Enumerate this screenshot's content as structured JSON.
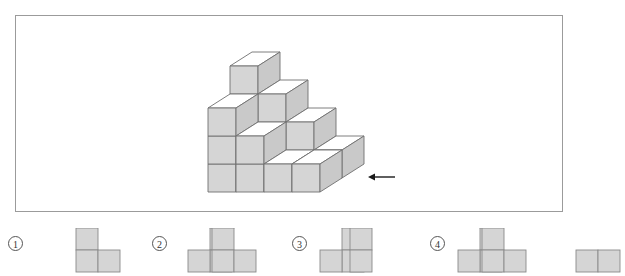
{
  "page": {
    "kind": "spatial-reasoning-question",
    "background_color": "#ffffff"
  },
  "panel": {
    "border_color": "#9b9b9b",
    "fill_color": "#ffffff",
    "figure": {
      "name": "isometric-cube-stack",
      "description": "Three-dimensional stack of unit cubes drawn in isometric projection",
      "cube_top_color": "#ffffff",
      "cube_left_color": "#d5d5d5",
      "cube_right_color": "#c9c9c9",
      "cube_edge_color": "#6f6f6f",
      "cube_unit_width": 28,
      "cube_unit_height": 28,
      "cube_depth_x": 22,
      "cube_depth_y": -14,
      "cubes": [
        {
          "x": 0,
          "y": 0,
          "z": 0
        },
        {
          "x": 0,
          "y": 0,
          "z": 1
        },
        {
          "x": 0,
          "y": 0,
          "z": 2
        },
        {
          "x": 1,
          "y": 0,
          "z": 0
        },
        {
          "x": 1,
          "y": 0,
          "z": 1
        },
        {
          "x": 2,
          "y": 0,
          "z": 0
        },
        {
          "x": 3,
          "y": 0,
          "z": 0
        },
        {
          "x": 0,
          "y": 1,
          "z": 0
        },
        {
          "x": 0,
          "y": 1,
          "z": 1
        },
        {
          "x": 0,
          "y": 1,
          "z": 2
        },
        {
          "x": 0,
          "y": 1,
          "z": 3
        },
        {
          "x": 1,
          "y": 1,
          "z": 0
        },
        {
          "x": 1,
          "y": 1,
          "z": 1
        },
        {
          "x": 1,
          "y": 1,
          "z": 2
        },
        {
          "x": 2,
          "y": 1,
          "z": 0
        },
        {
          "x": 2,
          "y": 1,
          "z": 1
        },
        {
          "x": 3,
          "y": 1,
          "z": 0
        }
      ]
    },
    "arrow": {
      "name": "left-arrow",
      "direction": "left",
      "color": "#1a1a1a",
      "meaning": "viewing direction"
    }
  },
  "options": {
    "cell_size": 22,
    "cell_fill": "#d5d5d5",
    "cell_stroke": "#8a8a8a",
    "items": [
      {
        "number": "①",
        "label": "1",
        "left": 8,
        "shapes": [
          {
            "name": "shape-a",
            "offset_x": 66,
            "cells": [
              [
                1,
                1
              ],
              [
                1,
                2
              ],
              [
                2,
                2
              ]
            ]
          },
          {
            "name": "shape-b",
            "offset_x": 200,
            "cells": [
              [
                1,
                0
              ],
              [
                1,
                1
              ],
              [
                1,
                2
              ],
              [
                0,
                2
              ]
            ]
          }
        ]
      },
      {
        "number": "②",
        "label": "2",
        "left": 152,
        "shapes": [
          {
            "name": "shape-a",
            "offset_x": 58,
            "cells": [
              [
                1,
                0
              ],
              [
                1,
                1
              ],
              [
                1,
                2
              ],
              [
                2,
                2
              ]
            ]
          },
          {
            "name": "shape-b",
            "offset_x": 188,
            "cells": [
              [
                1,
                0
              ],
              [
                1,
                1
              ],
              [
                1,
                2
              ],
              [
                0,
                2
              ]
            ]
          }
        ]
      },
      {
        "number": "③",
        "label": "3",
        "left": 292,
        "shapes": [
          {
            "name": "shape-a",
            "offset_x": 56,
            "cells": [
              [
                1,
                1
              ],
              [
                1,
                2
              ]
            ]
          },
          {
            "name": "shape-b",
            "offset_x": 186,
            "cells": [
              [
                1,
                0
              ],
              [
                1,
                1
              ],
              [
                1,
                2
              ],
              [
                0,
                2
              ]
            ]
          }
        ]
      },
      {
        "number": "④",
        "label": "4",
        "left": 430,
        "shapes": [
          {
            "name": "shape-a",
            "offset_x": 50,
            "cells": [
              [
                1,
                1
              ],
              [
                1,
                2
              ],
              [
                2,
                2
              ]
            ]
          },
          {
            "name": "shape-b",
            "offset_x": 166,
            "cells": [
              [
                0,
                2
              ],
              [
                1,
                2
              ]
            ]
          }
        ]
      }
    ]
  }
}
